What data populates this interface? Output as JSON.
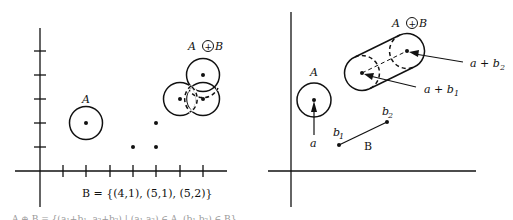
{
  "left_panel": {
    "label_A": "A",
    "label_AB_left": "A",
    "label_AB_op": "+",
    "label_AB_right": "B",
    "caption": "B = {(4,1), (5,1), (5,2)}",
    "footer_partial": "A ⊕ B = {(a₁+b₁, a₂+b₂) | (a₁,a₂) ∈ A, (b₁,b₂) ∈ B}",
    "grid_step_px": 23.3,
    "origin_px": [
      40,
      171
    ],
    "set_B": [
      [
        4,
        1
      ],
      [
        5,
        1
      ],
      [
        5,
        2
      ]
    ],
    "disk_A_center": [
      2,
      2
    ],
    "disk_A_radius": 0.7
  },
  "right_panel": {
    "label_A": "A",
    "label_AB_left": "A",
    "label_AB_op": "+",
    "label_AB_right": "B",
    "label_a": "a",
    "label_b1": "b",
    "label_b1_sub": "1",
    "label_b2": "b",
    "label_b2_sub": "2",
    "label_B": "B",
    "label_ab1": "a + b",
    "label_ab1_sub": "1",
    "label_ab2": "a + b",
    "label_ab2_sub": "2"
  }
}
